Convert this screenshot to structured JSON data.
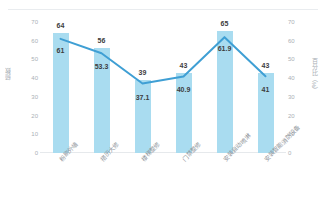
{
  "card": {
    "header_title": ""
  },
  "chart_data": {
    "type": "bar",
    "title": "",
    "subtitle": "",
    "xlabel": "",
    "ylabel": "频数",
    "y2label": "百分比（%）",
    "ylim": [
      0,
      70
    ],
    "y2lim": [
      0,
      70
    ],
    "grid": false,
    "legend_position": "none",
    "categories": [
      "粉刷外墙",
      "搭历大修",
      "楼梯整修",
      "门禁整修",
      "安装自动喷淋",
      "安装智能消防设备"
    ],
    "series": [
      {
        "name": "频数",
        "type": "bar",
        "axis": "left",
        "color": "#a9dcf0",
        "values": [
          64,
          56,
          39,
          43,
          65,
          43
        ]
      },
      {
        "name": "百分比（%）",
        "type": "line",
        "axis": "right",
        "color": "#3f9fd4",
        "values": [
          61,
          53.3,
          37.1,
          40.9,
          61.9,
          41
        ]
      }
    ],
    "bar_labels": [
      "64",
      "56",
      "39",
      "43",
      "65",
      "43"
    ],
    "line_labels": [
      "61",
      "53.3",
      "37.1",
      "40.9",
      "61.9",
      "41"
    ],
    "left_ticks": [
      "70",
      "60",
      "50",
      "40",
      "30",
      "20",
      "10",
      "0"
    ],
    "right_ticks": [
      "70",
      "60",
      "50",
      "40",
      "30",
      "20",
      "10",
      "0"
    ],
    "colors": {
      "bar": "#a9dcf0",
      "line": "#3f9fd4",
      "axis_text": "#aab0b6",
      "label_text": "#3d3d3d",
      "baseline": "#e6e9ec"
    }
  }
}
